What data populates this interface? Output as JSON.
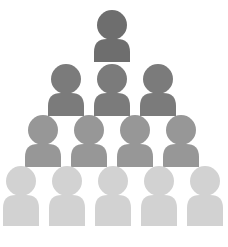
{
  "graphic": {
    "title": "People Pyramid Hierarchy",
    "type": "icon-illustration",
    "background_color": "#ffffff",
    "width": 228,
    "height": 247,
    "icon_name": "person-icon",
    "description": "Pyramid of person silhouettes arranged in four rows, shading from dark gray at the apex to light gray at the base",
    "rows": [
      {
        "row_index": 1,
        "level_label": "Top",
        "count": 1,
        "color": "#6e6e6e",
        "head_radius": 15,
        "head_center_y": 25,
        "body_top": 39,
        "body_bottom": 62,
        "body_half_width": 18,
        "body_corner_radius": 13,
        "people": [
          {
            "label": "Person 1",
            "center_x": 112
          }
        ]
      },
      {
        "row_index": 2,
        "level_label": "Second",
        "count": 3,
        "color": "#7b7b7b",
        "head_radius": 15,
        "head_center_y": 79,
        "body_top": 93,
        "body_bottom": 116,
        "body_half_width": 18,
        "body_corner_radius": 13,
        "people": [
          {
            "label": "Person 1",
            "center_x": 66
          },
          {
            "label": "Person 2",
            "center_x": 112
          },
          {
            "label": "Person 3",
            "center_x": 158
          }
        ]
      },
      {
        "row_index": 3,
        "level_label": "Third",
        "count": 4,
        "color": "#979797",
        "head_radius": 15,
        "head_center_y": 130,
        "body_top": 144,
        "body_bottom": 167,
        "body_half_width": 18,
        "body_corner_radius": 13,
        "people": [
          {
            "label": "Person 1",
            "center_x": 43
          },
          {
            "label": "Person 2",
            "center_x": 89
          },
          {
            "label": "Person 3",
            "center_x": 135
          },
          {
            "label": "Person 4",
            "center_x": 181
          }
        ]
      },
      {
        "row_index": 4,
        "level_label": "Base",
        "count": 5,
        "color": "#d2d2d2",
        "head_radius": 15,
        "head_center_y": 181,
        "body_top": 195,
        "body_bottom": 226,
        "body_half_width": 18,
        "body_corner_radius": 13,
        "people": [
          {
            "label": "Person 1",
            "center_x": 21
          },
          {
            "label": "Person 2",
            "center_x": 67
          },
          {
            "label": "Person 3",
            "center_x": 113
          },
          {
            "label": "Person 4",
            "center_x": 159
          },
          {
            "label": "Person 5",
            "center_x": 205
          }
        ]
      }
    ],
    "total_people": 13
  }
}
